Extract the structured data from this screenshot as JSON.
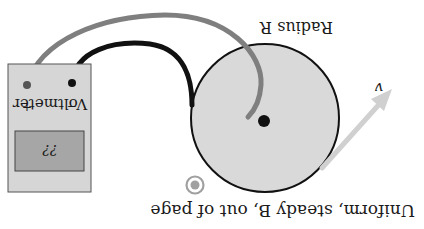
{
  "figure": {
    "orientation": "rotated-180",
    "labels": {
      "radius": "Radius R",
      "velocity": "v",
      "field": "Uniform, steady B, out of page",
      "voltmeter": "Voltmeter",
      "plus_terminal": "+",
      "minus_terminal": "−",
      "readout": "??"
    },
    "colors": {
      "disc_fill": "#d9d9d9",
      "disc_outline": "#111111",
      "gray_wire": "#7f7f7f",
      "black_wire": "#111111",
      "voltmeter_body": "#d6d6d6",
      "voltmeter_display": "#a6a6a6",
      "velocity_arrow": "#d0d0d0",
      "field_symbol": "#a0a0a0"
    }
  }
}
